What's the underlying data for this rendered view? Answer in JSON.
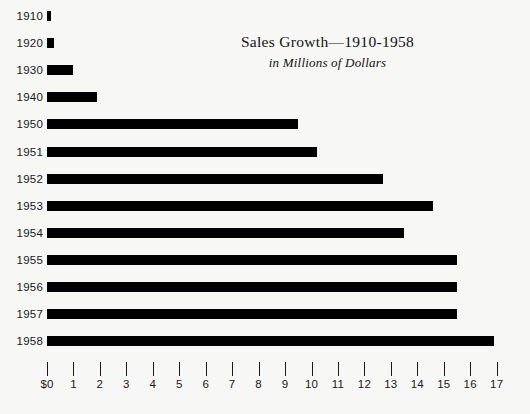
{
  "chart_data": {
    "type": "bar",
    "orientation": "horizontal",
    "title": "Sales Growth—1910-1958",
    "subtitle": "in Millions of Dollars",
    "xlabel": "",
    "ylabel": "",
    "xlim": [
      0,
      17
    ],
    "grid": false,
    "legend": null,
    "bar_color": "#000000",
    "background_color": "#f7f7f5",
    "text_color": "#1a1a1a",
    "x_tick_labels": [
      "$0",
      "1",
      "2",
      "3",
      "4",
      "5",
      "6",
      "7",
      "8",
      "9",
      "10",
      "11",
      "12",
      "13",
      "14",
      "15",
      "16",
      "17"
    ],
    "x_tick_values": [
      0,
      1,
      2,
      3,
      4,
      5,
      6,
      7,
      8,
      9,
      10,
      11,
      12,
      13,
      14,
      15,
      16,
      17
    ],
    "categories": [
      "1910",
      "1920",
      "1930",
      "1940",
      "1950",
      "1951",
      "1952",
      "1953",
      "1954",
      "1955",
      "1956",
      "1957",
      "1958"
    ],
    "values": [
      0.15,
      0.25,
      1.0,
      1.9,
      9.5,
      10.2,
      12.7,
      14.6,
      13.5,
      15.5,
      15.5,
      15.5,
      16.9
    ]
  }
}
